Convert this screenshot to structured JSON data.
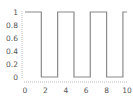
{
  "chart_data": {
    "type": "line",
    "title": "",
    "xlabel": "",
    "ylabel": "",
    "xlim": [
      0,
      10
    ],
    "ylim": [
      0,
      1
    ],
    "grid": false,
    "legend": null,
    "step": true,
    "x_ticks": [
      "0",
      "2",
      "4",
      "6",
      "8",
      "10"
    ],
    "y_ticks": [
      "0",
      "0.2",
      "0.4",
      "0.6",
      "0.8",
      "1"
    ],
    "series": [
      {
        "name": "square wave",
        "color": "#8a8a8a",
        "x": [
          0,
          1.6,
          1.6,
          3.2,
          3.2,
          4.8,
          4.8,
          6.4,
          6.4,
          8.0,
          8.0,
          9.6,
          9.6,
          10
        ],
        "y": [
          1,
          1,
          0,
          0,
          1,
          1,
          0,
          0,
          1,
          1,
          0,
          0,
          1,
          1
        ]
      }
    ]
  },
  "colors": {
    "line": "#8a8a8a",
    "axis": "#bbbbbb",
    "label": "#555555"
  }
}
